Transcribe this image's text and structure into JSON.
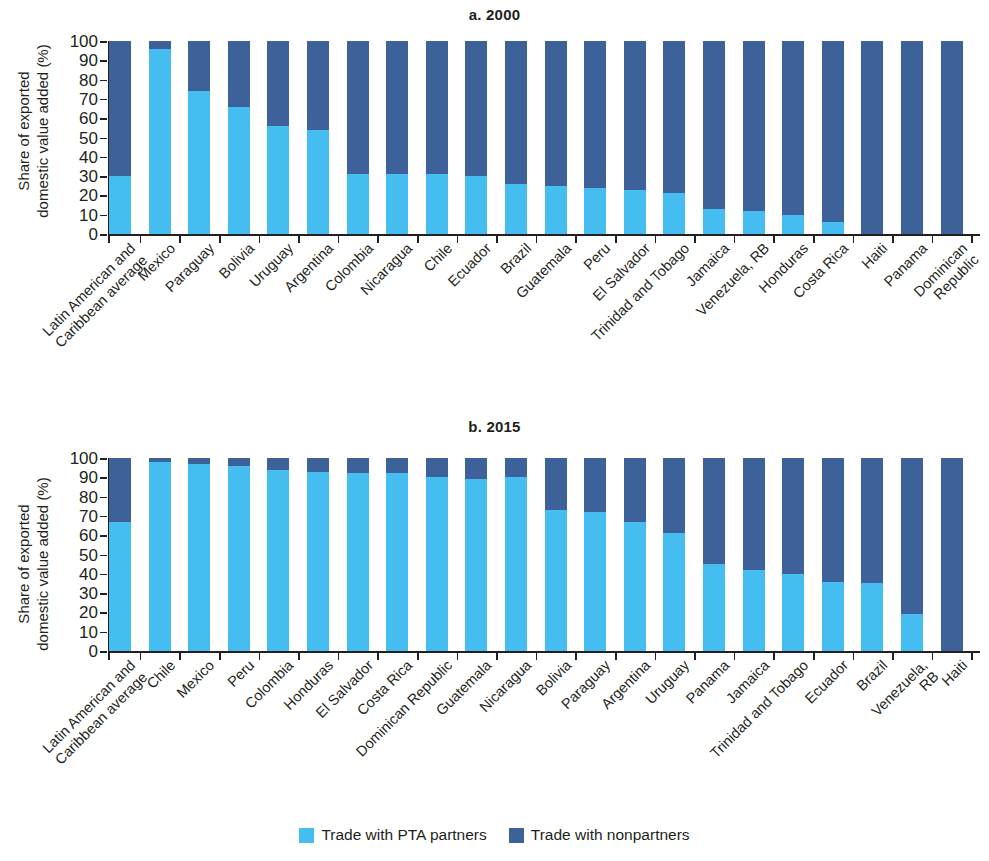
{
  "figure": {
    "ylabel": "Share of exported\ndomestic value added (%)",
    "legend": [
      {
        "label": "Trade with PTA partners",
        "color": "#45bdf0"
      },
      {
        "label": "Trade with nonpartners",
        "color": "#3d6199"
      }
    ]
  },
  "colors": {
    "pta": "#45bdf0",
    "nonpartners": "#3d6199",
    "axis": "#231f20",
    "background": "#ffffff"
  },
  "panel_a": {
    "title": "a. 2000",
    "ylabel": "Share of exported\ndomestic value added (%)"
  },
  "panel_b": {
    "title": "b. 2015",
    "ylabel": "Share of exported\ndomestic value added (%)"
  },
  "yticks": [
    "0",
    "10",
    "20",
    "30",
    "40",
    "50",
    "60",
    "70",
    "80",
    "90",
    "100"
  ],
  "chart_data": [
    {
      "type": "bar",
      "id": "panel-a",
      "title": "a. 2000",
      "xlabel": "",
      "ylabel": "Share of exported domestic value added (%)",
      "ylim": [
        0,
        100
      ],
      "ytick_values": [
        0,
        10,
        20,
        30,
        40,
        50,
        60,
        70,
        80,
        90,
        100
      ],
      "grid": false,
      "stacked": true,
      "legend_position": "bottom",
      "categories": [
        "Latin American and\nCaribbean average",
        "Mexico",
        "Paraguay",
        "Bolivia",
        "Uruguay",
        "Argentina",
        "Colombia",
        "Nicaragua",
        "Chile",
        "Ecuador",
        "Brazil",
        "Guatemala",
        "Peru",
        "El Salvador",
        "Trinidad and Tobago",
        "Jamaica",
        "Venezuela, RB",
        "Honduras",
        "Costa Rica",
        "Haiti",
        "Panama",
        "Dominican Republic"
      ],
      "series": [
        {
          "name": "Trade with PTA partners",
          "color": "#45bdf0",
          "values": [
            30,
            96,
            74,
            66,
            56,
            54,
            31,
            31,
            31,
            30,
            26,
            25,
            24,
            23,
            21,
            13,
            12,
            10,
            6,
            0,
            0,
            0
          ]
        },
        {
          "name": "Trade with nonpartners",
          "color": "#3d6199",
          "values": [
            70,
            4,
            26,
            34,
            44,
            46,
            69,
            69,
            69,
            70,
            74,
            75,
            76,
            77,
            79,
            87,
            88,
            90,
            94,
            100,
            100,
            100
          ]
        }
      ]
    },
    {
      "type": "bar",
      "id": "panel-b",
      "title": "b. 2015",
      "xlabel": "",
      "ylabel": "Share of exported domestic value added (%)",
      "ylim": [
        0,
        100
      ],
      "ytick_values": [
        0,
        10,
        20,
        30,
        40,
        50,
        60,
        70,
        80,
        90,
        100
      ],
      "grid": false,
      "stacked": true,
      "legend_position": "bottom",
      "categories": [
        "Latin American and\nCaribbean average",
        "Chile",
        "Mexico",
        "Peru",
        "Colombia",
        "Honduras",
        "El Salvador",
        "Costa Rica",
        "Dominican Republic",
        "Guatemala",
        "Nicaragua",
        "Bolivia",
        "Paraguay",
        "Argentina",
        "Uruguay",
        "Panama",
        "Jamaica",
        "Trinidad and Tobago",
        "Ecuador",
        "Brazil",
        "Venezuela, RB",
        "Haiti"
      ],
      "series": [
        {
          "name": "Trade with PTA partners",
          "color": "#45bdf0",
          "values": [
            67,
            98,
            97,
            96,
            94,
            93,
            92,
            92,
            90,
            89,
            90,
            73,
            72,
            67,
            61,
            45,
            42,
            40,
            36,
            35,
            19,
            0
          ]
        },
        {
          "name": "Trade with nonpartners",
          "color": "#3d6199",
          "values": [
            33,
            2,
            3,
            4,
            6,
            7,
            8,
            8,
            10,
            11,
            10,
            27,
            28,
            33,
            39,
            55,
            58,
            60,
            64,
            65,
            81,
            100
          ]
        }
      ]
    }
  ]
}
